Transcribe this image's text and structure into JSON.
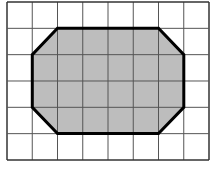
{
  "figure": {
    "grid": {
      "columns": 8,
      "rows": 6,
      "origin_px": [
        7,
        2
      ],
      "cell_w": 25.25,
      "cell_h": 26.33,
      "line_color": "#555555",
      "border_color": "#333333"
    },
    "shape": {
      "name": "octagon",
      "fill": "#bdbdbd",
      "stroke": "#000000",
      "stroke_width": 3,
      "vertices_grid": [
        [
          2,
          1
        ],
        [
          6,
          1
        ],
        [
          7,
          2
        ],
        [
          7,
          4
        ],
        [
          6,
          5
        ],
        [
          2,
          5
        ],
        [
          1,
          4
        ],
        [
          1,
          2
        ]
      ]
    }
  }
}
